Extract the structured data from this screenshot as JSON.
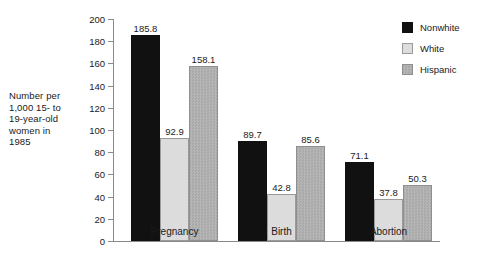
{
  "chart_data": {
    "type": "bar",
    "title": "",
    "subtitle": "",
    "xlabel": "",
    "ylabel": "Number per\n1,000 15- to\n19-year-old\nwomen in\n1985",
    "categories": [
      "Pregnancy",
      "Birth",
      "Abortion"
    ],
    "series": [
      {
        "name": "Nonwhite",
        "color": "#111111",
        "values": [
          185.8,
          89.7,
          71.1
        ]
      },
      {
        "name": "White",
        "color": "#dcdcdc",
        "values": [
          92.9,
          42.8,
          37.8
        ]
      },
      {
        "name": "Hispanic",
        "color": "#b0b0b0",
        "values": [
          158.1,
          85.6,
          50.3
        ]
      }
    ],
    "value_labels": [
      [
        "185.8",
        "92.9",
        "158.1"
      ],
      [
        "89.7",
        "42.8",
        "85.6"
      ],
      [
        "71.1",
        "37.8",
        "50.3"
      ]
    ],
    "ylim": [
      0,
      200
    ],
    "ytick_values": [
      0,
      20,
      40,
      60,
      80,
      100,
      120,
      140,
      160,
      180,
      200
    ],
    "ytick_labels": [
      "0",
      "20",
      "40",
      "60",
      "80",
      "100",
      "120",
      "140",
      "160",
      "180",
      "200"
    ],
    "grid": false,
    "legend_position": "right-top",
    "legend_entries": [
      "Nonwhite",
      "White",
      "Hispanic"
    ]
  }
}
